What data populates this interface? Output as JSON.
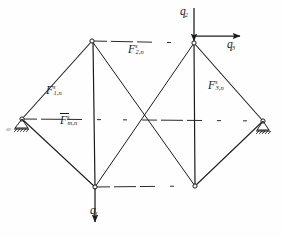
{
  "figure": {
    "kind": "structural-truss-diagram",
    "style": "hand-drawn line drawing, black ink on white",
    "ink_color": "#1b1b1b",
    "background_color": "#fefefe",
    "width": 284,
    "height": 237
  },
  "nodes": [
    {
      "id": "left-support",
      "name": "left pinned support",
      "x": 22,
      "y": 119,
      "marker": "small-circle",
      "support": "pinned-hatched"
    },
    {
      "id": "top-left",
      "name": "upper left joint",
      "x": 92,
      "y": 41,
      "marker": "small-circle",
      "support": "none"
    },
    {
      "id": "top-right",
      "name": "upper right joint",
      "x": 194,
      "y": 43,
      "marker": "small-circle",
      "support": "none"
    },
    {
      "id": "right-support",
      "name": "right pinned support",
      "x": 263,
      "y": 121,
      "marker": "small-circle",
      "support": "pinned-hatched"
    },
    {
      "id": "bottom-left",
      "name": "lower left joint",
      "x": 95,
      "y": 187,
      "marker": "small-circle",
      "support": "none"
    },
    {
      "id": "bottom-right",
      "name": "lower right joint",
      "x": 195,
      "y": 186,
      "marker": "small-circle",
      "support": "none"
    }
  ],
  "members": [
    {
      "from": "left-support",
      "to": "top-left",
      "style": "solid"
    },
    {
      "from": "left-support",
      "to": "bottom-left",
      "style": "solid"
    },
    {
      "from": "left-support",
      "to": "right-support",
      "style": "dashed-chord"
    },
    {
      "from": "top-left",
      "to": "top-right",
      "style": "dashed-chord"
    },
    {
      "from": "top-left",
      "to": "bottom-left",
      "style": "solid-vertical"
    },
    {
      "from": "top-left",
      "to": "bottom-right",
      "style": "solid-diagonal"
    },
    {
      "from": "top-right",
      "to": "bottom-left",
      "style": "solid-diagonal"
    },
    {
      "from": "top-right",
      "to": "bottom-right",
      "style": "solid-vertical"
    },
    {
      "from": "top-right",
      "to": "right-support",
      "style": "solid"
    },
    {
      "from": "bottom-right",
      "to": "right-support",
      "style": "solid"
    },
    {
      "from": "bottom-left",
      "to": "bottom-right",
      "style": "dashed-chord"
    }
  ],
  "member_labels": [
    {
      "id": "F1n",
      "base": "F",
      "sup": "s",
      "sub": "1,n",
      "overbar": false,
      "x": 46,
      "y": 84,
      "for": "left-support-to-top-left"
    },
    {
      "id": "F2n",
      "base": "F",
      "sup": "s",
      "sub": "2,n",
      "overbar": false,
      "x": 128,
      "y": 43,
      "for": "top-left-to-top-right"
    },
    {
      "id": "F3n",
      "base": "F",
      "sup": "s",
      "sub": "3,n",
      "overbar": false,
      "x": 208,
      "y": 79,
      "for": "top-right-to-right-support"
    },
    {
      "id": "Fmn",
      "base": "F",
      "sup": "s",
      "sub": "m,n",
      "overbar": true,
      "x": 60,
      "y": 114,
      "for": "left-support-to-right-support"
    }
  ],
  "loads": [
    {
      "id": "q1",
      "base": "q",
      "sub": "1",
      "direction": "down",
      "at_node": "bottom-left",
      "label_x": 90,
      "label_y": 209,
      "arrow": {
        "x1": 95,
        "y1": 187,
        "x2": 95,
        "y2": 224
      }
    },
    {
      "id": "q2",
      "base": "q",
      "sub": "2",
      "direction": "down",
      "at_node": "top-right",
      "label_x": 180,
      "label_y": 9,
      "arrow": {
        "x1": 194,
        "y1": 8,
        "x2": 194,
        "y2": 43
      }
    },
    {
      "id": "q3",
      "base": "q",
      "sub": "3",
      "direction": "right",
      "at_node": "top-right",
      "label_x": 227,
      "label_y": 42,
      "arrow": {
        "x1": 194,
        "y1": 36,
        "x2": 242,
        "y2": 36
      }
    }
  ],
  "support_labels": [
    {
      "id": "left-hatch",
      "text": "////",
      "x": 6,
      "y": 126
    },
    {
      "id": "right-hatch",
      "text": "////",
      "x": 262,
      "y": 128
    }
  ]
}
